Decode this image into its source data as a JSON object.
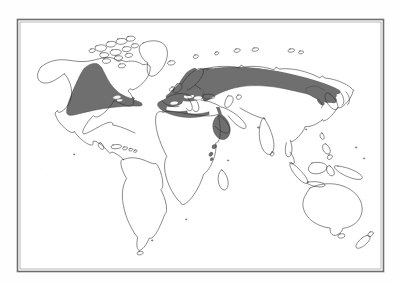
{
  "figure": {
    "kind": "world-distribution-map",
    "projection": "robinson",
    "frame": {
      "x": 17,
      "y": 19,
      "width": 367,
      "height": 253,
      "border_color": "#6e6e6e",
      "inner_border_color": "#9a9a9a",
      "border_width_px": 1.6
    },
    "background_color": "#ffffff",
    "page_color": "#fefefe",
    "coastline_color": "#2b2b2b",
    "coastline_width_px": 0.55,
    "range_fill_color": "#6f6f6f",
    "range_stroke_color": "#4a4a4a",
    "caption_ghost_text": "",
    "title": "",
    "legend": {
      "visible": false,
      "entries": []
    },
    "labels": [],
    "axis_labels": [],
    "scalebar": {
      "visible": false
    },
    "north_arrow": {
      "visible": false
    },
    "graticule": {
      "visible": false
    }
  },
  "regions": [
    {
      "id": "north-america-range",
      "name": "North America shaded range",
      "fill": "#6f6f6f"
    },
    {
      "id": "europe-mediterranean-range",
      "name": "Europe and Mediterranean shaded range",
      "fill": "#6f6f6f"
    },
    {
      "id": "eurasia-belt-range",
      "name": "Central and northern Asia shaded belt",
      "fill": "#6f6f6f"
    },
    {
      "id": "east-asia-range",
      "name": "Korea, Japan and northeast China shaded range",
      "fill": "#6f6f6f"
    },
    {
      "id": "ethiopia-range",
      "name": "Ethiopian highlands shaded range",
      "fill": "#6f6f6f"
    },
    {
      "id": "east-africa-patch-a",
      "name": "East Africa shaded patch",
      "fill": "#6f6f6f"
    },
    {
      "id": "east-africa-patch-b",
      "name": "East Africa shaded patch",
      "fill": "#6f6f6f"
    },
    {
      "id": "east-africa-patch-c",
      "name": "East Africa shaded patch",
      "fill": "#6f6f6f"
    }
  ],
  "landmasses": [
    {
      "id": "north-america",
      "name": "North America"
    },
    {
      "id": "greenland",
      "name": "Greenland"
    },
    {
      "id": "canadian-arctic",
      "name": "Canadian Arctic archipelago"
    },
    {
      "id": "south-america",
      "name": "South America"
    },
    {
      "id": "africa",
      "name": "Africa"
    },
    {
      "id": "europe",
      "name": "Europe"
    },
    {
      "id": "asia",
      "name": "Asia"
    },
    {
      "id": "india",
      "name": "Indian subcontinent"
    },
    {
      "id": "southeast-asia",
      "name": "Southeast Asia and Indonesia"
    },
    {
      "id": "japan",
      "name": "Japan"
    },
    {
      "id": "australia",
      "name": "Australia"
    },
    {
      "id": "new-zealand",
      "name": "New Zealand"
    },
    {
      "id": "madagascar",
      "name": "Madagascar"
    },
    {
      "id": "british-isles",
      "name": "British Isles"
    },
    {
      "id": "iceland",
      "name": "Iceland"
    },
    {
      "id": "philippines",
      "name": "Philippines"
    },
    {
      "id": "new-guinea",
      "name": "New Guinea"
    },
    {
      "id": "caribbean",
      "name": "Caribbean islands"
    }
  ]
}
